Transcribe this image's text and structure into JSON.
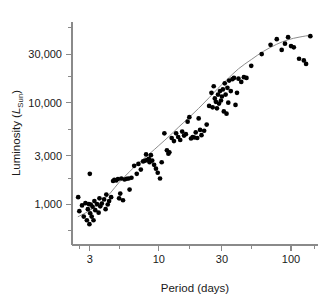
{
  "chart_data": {
    "type": "scatter",
    "title": "",
    "xlabel": "Period (days)",
    "ylabel": "Luminosity (L_Sun)",
    "ylabel_parts": {
      "prefix": "Luminosity (",
      "symbol": "L",
      "subscript": "Sun",
      "suffix": ")"
    },
    "xscale": "log",
    "yscale": "log",
    "xlim": [
      2.2,
      160
    ],
    "ylim": [
      400,
      62000
    ],
    "xticks": [
      3,
      10,
      30,
      100
    ],
    "xticklabels": [
      "3",
      "10",
      "30",
      "100"
    ],
    "xminorticks": [
      2.5,
      5,
      17,
      50,
      150
    ],
    "yticks": [
      1000,
      3000,
      10000,
      30000
    ],
    "yticklabels": [
      "1,000",
      "3,000",
      "10,000",
      "30,000"
    ],
    "yminorticks": [
      550,
      1800,
      5500,
      18000,
      55000
    ],
    "grid": false,
    "legend": false,
    "point_color": "#000000",
    "curve_color": "#8d8d8d",
    "axis_color": "#8a8a8a",
    "series": [
      {
        "name": "Cepheid variables",
        "marker": "filled-circle",
        "points": [
          [
            2.45,
            1180
          ],
          [
            2.5,
            860
          ],
          [
            2.62,
            980
          ],
          [
            2.7,
            760
          ],
          [
            2.78,
            1030
          ],
          [
            2.85,
            700
          ],
          [
            2.9,
            900
          ],
          [
            2.95,
            1010
          ],
          [
            2.98,
            640
          ],
          [
            3.0,
            2000
          ],
          [
            3.02,
            820
          ],
          [
            3.05,
            1000
          ],
          [
            3.1,
            760
          ],
          [
            3.15,
            950
          ],
          [
            3.2,
            700
          ],
          [
            3.25,
            1080
          ],
          [
            3.3,
            880
          ],
          [
            3.4,
            1010
          ],
          [
            3.5,
            830
          ],
          [
            3.55,
            1150
          ],
          [
            3.6,
            960
          ],
          [
            3.7,
            1020
          ],
          [
            3.85,
            1120
          ],
          [
            3.95,
            900
          ],
          [
            4.0,
            1250
          ],
          [
            4.1,
            1000
          ],
          [
            4.2,
            1080
          ],
          [
            4.35,
            1180
          ],
          [
            4.5,
            1700
          ],
          [
            4.6,
            1750
          ],
          [
            4.75,
            1720
          ],
          [
            4.9,
            1780
          ],
          [
            5.0,
            1150
          ],
          [
            5.1,
            1280
          ],
          [
            5.2,
            1800
          ],
          [
            5.35,
            1100
          ],
          [
            5.5,
            1760
          ],
          [
            5.7,
            1790
          ],
          [
            5.9,
            1800
          ],
          [
            6.0,
            1400
          ],
          [
            6.2,
            1830
          ],
          [
            6.5,
            2400
          ],
          [
            6.8,
            2000
          ],
          [
            7.0,
            2500
          ],
          [
            7.3,
            2200
          ],
          [
            7.6,
            2650
          ],
          [
            7.9,
            2700
          ],
          [
            8.0,
            3100
          ],
          [
            8.2,
            2750
          ],
          [
            8.4,
            2800
          ],
          [
            8.5,
            2600
          ],
          [
            8.7,
            3050
          ],
          [
            8.9,
            2700
          ],
          [
            9.2,
            2450
          ],
          [
            9.5,
            2250
          ],
          [
            9.8,
            2050
          ],
          [
            10.2,
            1800
          ],
          [
            10.5,
            2600
          ],
          [
            11.0,
            5000
          ],
          [
            11.5,
            3400
          ],
          [
            11.8,
            3150
          ],
          [
            12.0,
            3250
          ],
          [
            12.5,
            4500
          ],
          [
            13.0,
            4200
          ],
          [
            13.5,
            5000
          ],
          [
            14.0,
            4600
          ],
          [
            14.5,
            4300
          ],
          [
            15.0,
            5200
          ],
          [
            15.5,
            4750
          ],
          [
            16.0,
            4900
          ],
          [
            16.5,
            6500
          ],
          [
            17.0,
            7200
          ],
          [
            17.5,
            4450
          ],
          [
            18.0,
            4600
          ],
          [
            18.5,
            4550
          ],
          [
            19.0,
            5100
          ],
          [
            19.5,
            4500
          ],
          [
            20.0,
            7000
          ],
          [
            20.5,
            5400
          ],
          [
            21.0,
            4800
          ],
          [
            22.0,
            5300
          ],
          [
            23.0,
            6100
          ],
          [
            24.0,
            9300
          ],
          [
            25.0,
            12500
          ],
          [
            25.5,
            9000
          ],
          [
            26.0,
            14500
          ],
          [
            26.5,
            11000
          ],
          [
            27.0,
            10200
          ],
          [
            27.5,
            8800
          ],
          [
            28.0,
            12000
          ],
          [
            28.5,
            9800
          ],
          [
            29.0,
            13000
          ],
          [
            29.5,
            10500
          ],
          [
            30.0,
            11500
          ],
          [
            30.5,
            13500
          ],
          [
            31.0,
            8200
          ],
          [
            31.5,
            15500
          ],
          [
            32.0,
            12000
          ],
          [
            32.5,
            7800
          ],
          [
            33.0,
            14000
          ],
          [
            33.5,
            10000
          ],
          [
            34.0,
            16500
          ],
          [
            35.0,
            13000
          ],
          [
            36.0,
            17000
          ],
          [
            37.0,
            17500
          ],
          [
            38.0,
            9500
          ],
          [
            39.0,
            12500
          ],
          [
            40.0,
            17200
          ],
          [
            42.0,
            16000
          ],
          [
            44.0,
            17800
          ],
          [
            46.0,
            17500
          ],
          [
            50.0,
            23000
          ],
          [
            60.0,
            30000
          ],
          [
            70.0,
            37000
          ],
          [
            78.0,
            42000
          ],
          [
            85.0,
            33000
          ],
          [
            90.0,
            38000
          ],
          [
            95.0,
            44000
          ],
          [
            100.0,
            36000
          ],
          [
            105.0,
            35000
          ],
          [
            115.0,
            27000
          ],
          [
            125.0,
            26000
          ],
          [
            130.0,
            24000
          ],
          [
            140.0,
            45000
          ]
        ]
      }
    ],
    "fit_curve": {
      "name": "best-fit period-luminosity relation",
      "points": [
        [
          2.45,
          760
        ],
        [
          2.8,
          830
        ],
        [
          3.2,
          920
        ],
        [
          3.7,
          1060
        ],
        [
          4.3,
          1300
        ],
        [
          5.0,
          1650
        ],
        [
          6.0,
          2100
        ],
        [
          7.0,
          2550
        ],
        [
          8.5,
          3150
        ],
        [
          10.0,
          3800
        ],
        [
          12.0,
          4700
        ],
        [
          14.0,
          5700
        ],
        [
          17.0,
          7200
        ],
        [
          20.0,
          8800
        ],
        [
          24.0,
          11200
        ],
        [
          28.0,
          13800
        ],
        [
          33.0,
          17000
        ],
        [
          40.0,
          21500
        ],
        [
          50.0,
          26500
        ],
        [
          62.0,
          32000
        ],
        [
          78.0,
          37500
        ],
        [
          95.0,
          41500
        ],
        [
          115.0,
          44000
        ],
        [
          140.0,
          46000
        ]
      ]
    }
  }
}
